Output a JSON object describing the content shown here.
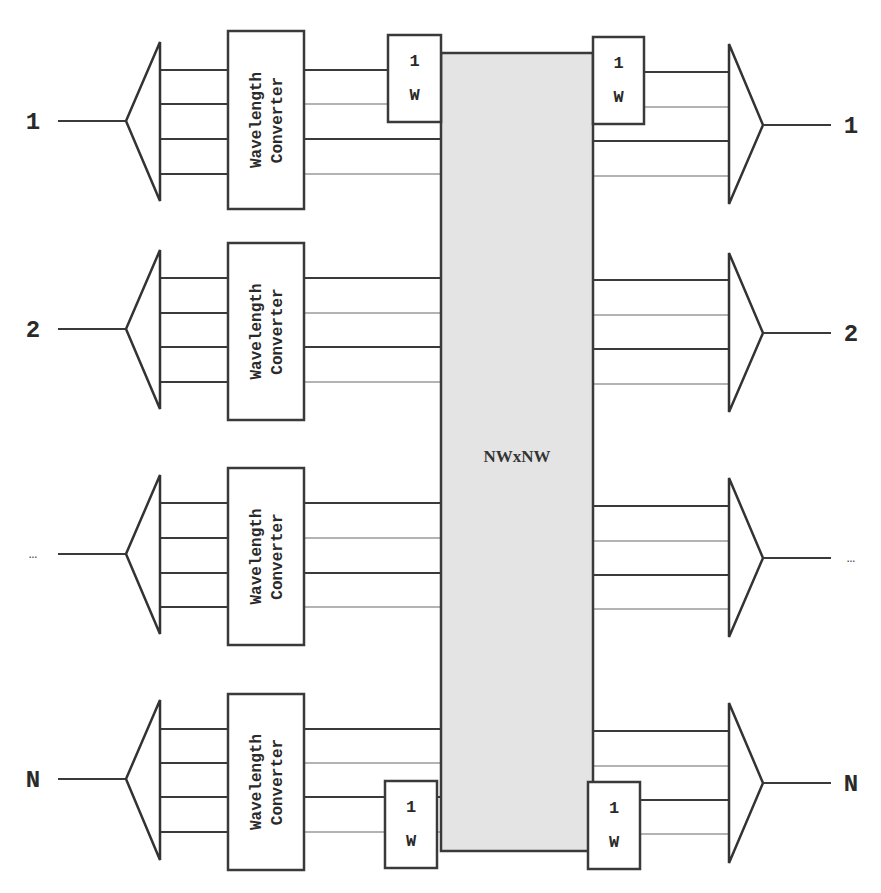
{
  "diagram": {
    "core_label": "NWxNW",
    "core_fill": "#e4e4e4",
    "line_color_dark": "#3a3a3a",
    "line_color_light": "#9a9a9a",
    "converter_line1": "Wavelength",
    "converter_line2": "Converter",
    "wl_box_line1": "1",
    "wl_box_line2": "W",
    "left_ports": [
      {
        "label": "1",
        "apex_y": 121,
        "base_top": 42,
        "base_bottom": 201,
        "lines": [
          70,
          104,
          139,
          174
        ],
        "box_top": 31,
        "box_bottom": 209
      },
      {
        "label": "2",
        "apex_y": 329,
        "base_top": 250,
        "base_bottom": 409,
        "lines": [
          278,
          313,
          347,
          382
        ],
        "box_top": 243,
        "box_bottom": 420
      },
      {
        "label": "...",
        "apex_y": 554,
        "base_top": 475,
        "base_bottom": 634,
        "lines": [
          503,
          538,
          573,
          607
        ],
        "box_top": 468,
        "box_bottom": 645
      },
      {
        "label": "N",
        "apex_y": 779,
        "base_top": 700,
        "base_bottom": 860,
        "lines": [
          729,
          763,
          797,
          832
        ],
        "box_top": 694,
        "box_bottom": 870
      }
    ],
    "right_ports": [
      {
        "label": "1",
        "apex_y": 125,
        "base_top": 44,
        "base_bottom": 204,
        "lines": [
          72,
          107,
          141,
          176
        ]
      },
      {
        "label": "2",
        "apex_y": 333,
        "base_top": 253,
        "base_bottom": 412,
        "lines": [
          280,
          315,
          349,
          384
        ]
      },
      {
        "label": "...",
        "apex_y": 558,
        "base_top": 478,
        "base_bottom": 637,
        "lines": [
          506,
          541,
          575,
          609
        ]
      },
      {
        "label": "N",
        "apex_y": 783,
        "base_top": 703,
        "base_bottom": 863,
        "lines": [
          731,
          766,
          800,
          834
        ]
      }
    ],
    "wl_boxes": [
      {
        "name": "wl-box-top-left",
        "x": 388,
        "y": 35,
        "w": 53,
        "h": 87
      },
      {
        "name": "wl-box-top-right",
        "x": 593,
        "y": 37,
        "w": 51,
        "h": 87
      },
      {
        "name": "wl-box-bottom-left",
        "x": 385,
        "y": 781,
        "w": 52,
        "h": 87
      },
      {
        "name": "wl-box-bottom-right",
        "x": 588,
        "y": 782,
        "w": 52,
        "h": 87
      }
    ]
  }
}
